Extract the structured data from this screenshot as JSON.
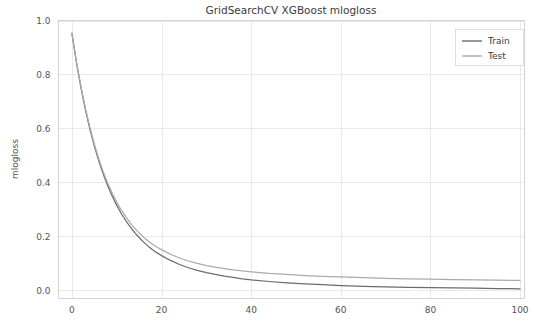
{
  "chart_data": {
    "type": "line",
    "title": "GridSearchCV XGBoost mlogloss",
    "xlabel": "",
    "ylabel": "mlogloss",
    "xlim": [
      -3,
      101
    ],
    "ylim": [
      -0.03,
      1.0
    ],
    "xticks": [
      0,
      20,
      40,
      60,
      80,
      100
    ],
    "xtick_labels": [
      "0",
      "20",
      "40",
      "60",
      "80",
      "100"
    ],
    "yticks": [
      0.0,
      0.2,
      0.4,
      0.6,
      0.8,
      1.0
    ],
    "ytick_labels": [
      "0.0",
      "0.2",
      "0.4",
      "0.6",
      "0.8",
      "1.0"
    ],
    "grid": true,
    "legend_position": "upper right",
    "x": [
      0,
      1,
      2,
      3,
      4,
      5,
      6,
      7,
      8,
      9,
      10,
      11,
      12,
      13,
      14,
      15,
      16,
      17,
      18,
      19,
      20,
      22,
      24,
      26,
      28,
      30,
      32,
      34,
      36,
      38,
      40,
      44,
      48,
      52,
      56,
      60,
      65,
      70,
      75,
      80,
      85,
      90,
      95,
      100
    ],
    "series": [
      {
        "name": "Train",
        "color": "#6b6b6b",
        "values": [
          0.952,
          0.845,
          0.752,
          0.67,
          0.598,
          0.535,
          0.479,
          0.43,
          0.387,
          0.349,
          0.315,
          0.285,
          0.259,
          0.235,
          0.214,
          0.196,
          0.179,
          0.164,
          0.151,
          0.139,
          0.129,
          0.111,
          0.096,
          0.084,
          0.074,
          0.066,
          0.059,
          0.053,
          0.048,
          0.043,
          0.039,
          0.033,
          0.028,
          0.024,
          0.021,
          0.018,
          0.015,
          0.013,
          0.011,
          0.01,
          0.009,
          0.008,
          0.007,
          0.006
        ]
      },
      {
        "name": "Test",
        "color": "#aaaaaa",
        "values": [
          0.953,
          0.847,
          0.756,
          0.675,
          0.604,
          0.542,
          0.487,
          0.439,
          0.397,
          0.36,
          0.327,
          0.298,
          0.273,
          0.25,
          0.23,
          0.213,
          0.197,
          0.183,
          0.171,
          0.16,
          0.151,
          0.134,
          0.12,
          0.109,
          0.1,
          0.092,
          0.086,
          0.081,
          0.076,
          0.072,
          0.069,
          0.063,
          0.059,
          0.055,
          0.052,
          0.05,
          0.047,
          0.045,
          0.043,
          0.042,
          0.04,
          0.039,
          0.038,
          0.037
        ]
      }
    ],
    "legend_entries": [
      "Train",
      "Test"
    ],
    "colors": {
      "train_line": "#6b6b6b",
      "test_line": "#aaaaaa",
      "grid": "#e3e3e3",
      "axis_border": "#d0d0d0",
      "text": "#3b3b3b",
      "background": "#ffffff"
    }
  }
}
